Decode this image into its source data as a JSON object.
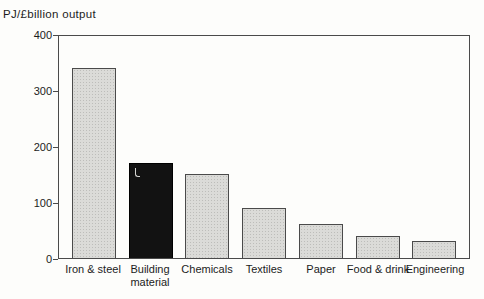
{
  "chart_data": {
    "type": "bar",
    "title": "PJ/£billion output",
    "ylabel": "PJ/£billion output",
    "xlabel": "",
    "categories": [
      "Iron & steel",
      "Building material",
      "Chemicals",
      "Textiles",
      "Paper",
      "Food & drink",
      "Engineering"
    ],
    "values": [
      340,
      170,
      150,
      90,
      60,
      40,
      30
    ],
    "bar_styles": [
      "stipple",
      "black",
      "stipple",
      "stipple",
      "stipple",
      "stipple",
      "stipple"
    ],
    "categories_wrap": [
      false,
      true,
      false,
      false,
      false,
      false,
      false
    ],
    "ylim": [
      0,
      400
    ],
    "yticks": [
      0,
      100,
      200,
      300,
      400
    ],
    "grid": false,
    "legend_position": "none",
    "colors": {
      "bar_fill": "#dbdbd8",
      "bar_highlight": "#121212",
      "axis": "#4a4a4a",
      "text": "#1c1c1c",
      "background": "#fdfdfb"
    }
  }
}
